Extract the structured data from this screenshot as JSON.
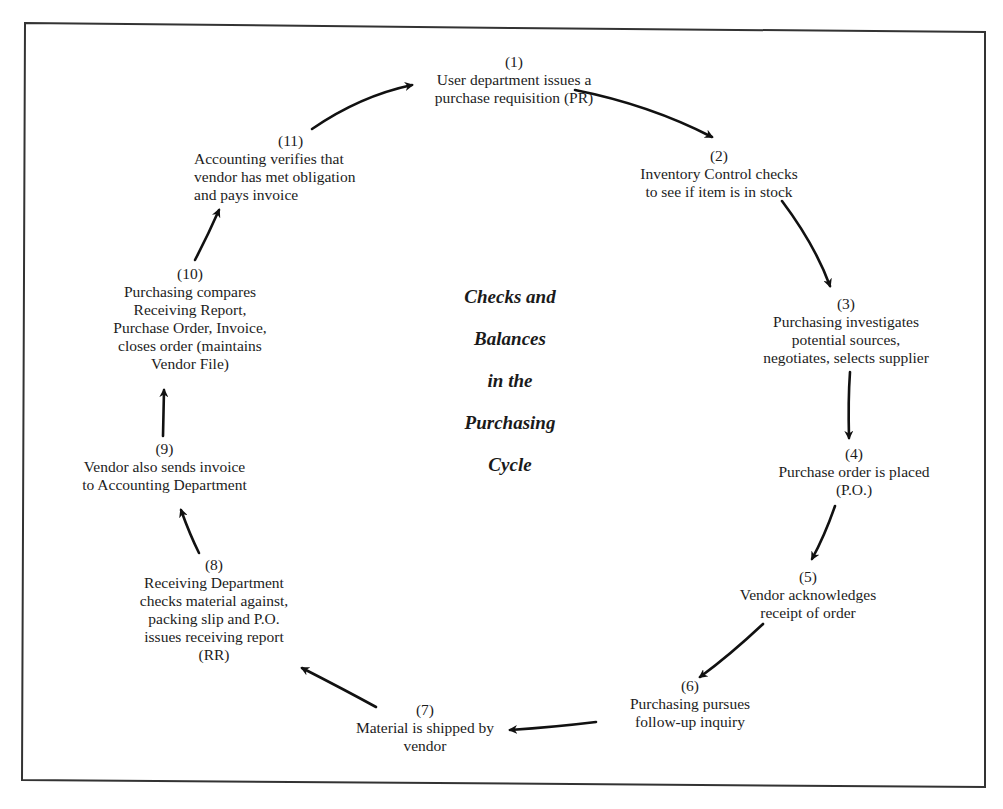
{
  "diagram": {
    "title_lines": [
      "Checks and",
      "Balances",
      "in the",
      "Purchasing",
      "Cycle"
    ],
    "steps": [
      {
        "num": "(1)",
        "lines": [
          "User department issues a",
          "purchase requisition (PR)"
        ]
      },
      {
        "num": "(2)",
        "lines": [
          "Inventory Control checks",
          "to see if item is in stock"
        ]
      },
      {
        "num": "(3)",
        "lines": [
          "Purchasing investigates",
          "potential sources,",
          "negotiates, selects supplier"
        ]
      },
      {
        "num": "(4)",
        "lines": [
          "Purchase order is placed",
          "(P.O.)"
        ]
      },
      {
        "num": "(5)",
        "lines": [
          "Vendor acknowledges",
          "receipt of order"
        ]
      },
      {
        "num": "(6)",
        "lines": [
          "Purchasing pursues",
          "follow-up inquiry"
        ]
      },
      {
        "num": "(7)",
        "lines": [
          "Material is shipped by",
          "vendor"
        ]
      },
      {
        "num": "(8)",
        "lines": [
          "Receiving Department",
          "checks material against,",
          "packing slip and P.O.",
          "issues receiving report",
          "(RR)"
        ]
      },
      {
        "num": "(9)",
        "lines": [
          "Vendor also sends invoice",
          "to Accounting Department"
        ]
      },
      {
        "num": "(10)",
        "lines": [
          "Purchasing compares",
          "Receiving Report,",
          "Purchase Order, Invoice,",
          "closes order (maintains",
          "Vendor File)"
        ]
      },
      {
        "num": "(11)",
        "lines": [
          "Accounting verifies that",
          "vendor has met obligation",
          "and pays invoice"
        ]
      }
    ],
    "arrows": [
      {
        "from": "(1)",
        "to": "(2)"
      },
      {
        "from": "(2)",
        "to": "(3)"
      },
      {
        "from": "(3)",
        "to": "(4)"
      },
      {
        "from": "(4)",
        "to": "(5)"
      },
      {
        "from": "(5)",
        "to": "(6)"
      },
      {
        "from": "(6)",
        "to": "(7)"
      },
      {
        "from": "(7)",
        "to": "(8)"
      },
      {
        "from": "(8)",
        "to": "(9)"
      },
      {
        "from": "(9)",
        "to": "(10)"
      },
      {
        "from": "(10)",
        "to": "(11)"
      },
      {
        "from": "(11)",
        "to": "(1)"
      }
    ],
    "colors": {
      "ink": "#1a1a1a",
      "frame": "#333333",
      "background": "#ffffff"
    }
  }
}
